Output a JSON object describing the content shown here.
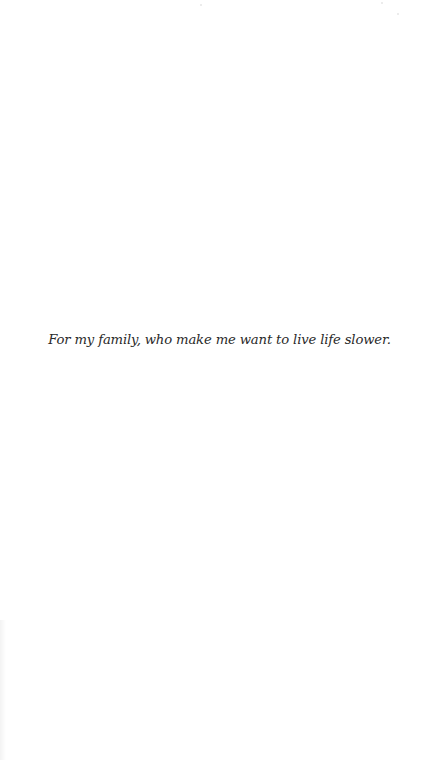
{
  "page": {
    "dedication": "For my family, who make me want to live life slower."
  }
}
